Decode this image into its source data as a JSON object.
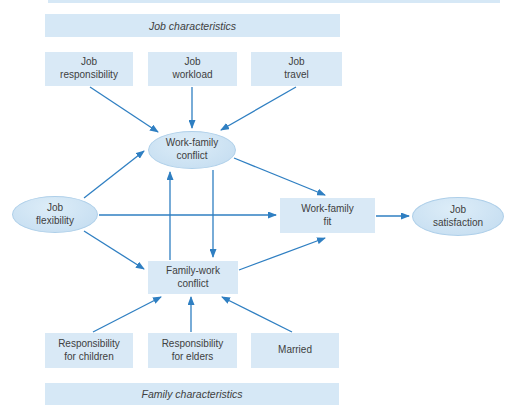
{
  "colors": {
    "box_fill": "#d9e9f6",
    "banner_fill": "#d6e8f6",
    "ellipse_fill_light": "#ddedf8",
    "ellipse_fill_dark": "#c3dcf0",
    "ellipse_border": "#aecfe9",
    "arrow": "#2f7fc2",
    "text": "#404040",
    "bg": "#ffffff"
  },
  "banners": {
    "top": "Job characteristics",
    "bottom": "Family characteristics"
  },
  "nodes": {
    "job_responsibility": "Job\nresponsibility",
    "job_workload": "Job\nworkload",
    "job_travel": "Job\ntravel",
    "work_family_conflict": "Work-family\nconflict",
    "job_flexibility": "Job\nflexibility",
    "work_family_fit": "Work-family\nfit",
    "job_satisfaction": "Job\nsatisfaction",
    "family_work_conflict": "Family-work\nconflict",
    "responsibility_children": "Responsibility\nfor children",
    "responsibility_elders": "Responsibility\nfor elders",
    "married": "Married"
  },
  "edges": [
    {
      "from": "job_responsibility",
      "to": "work_family_conflict"
    },
    {
      "from": "job_workload",
      "to": "work_family_conflict"
    },
    {
      "from": "job_travel",
      "to": "work_family_conflict"
    },
    {
      "from": "job_flexibility",
      "to": "work_family_conflict"
    },
    {
      "from": "job_flexibility",
      "to": "work_family_fit"
    },
    {
      "from": "job_flexibility",
      "to": "family_work_conflict"
    },
    {
      "from": "work_family_conflict",
      "to": "work_family_fit"
    },
    {
      "from": "family_work_conflict",
      "to": "work_family_conflict"
    },
    {
      "from": "work_family_conflict",
      "to": "family_work_conflict"
    },
    {
      "from": "family_work_conflict",
      "to": "work_family_fit"
    },
    {
      "from": "responsibility_children",
      "to": "family_work_conflict"
    },
    {
      "from": "responsibility_elders",
      "to": "family_work_conflict"
    },
    {
      "from": "married",
      "to": "family_work_conflict"
    },
    {
      "from": "work_family_fit",
      "to": "job_satisfaction"
    }
  ]
}
